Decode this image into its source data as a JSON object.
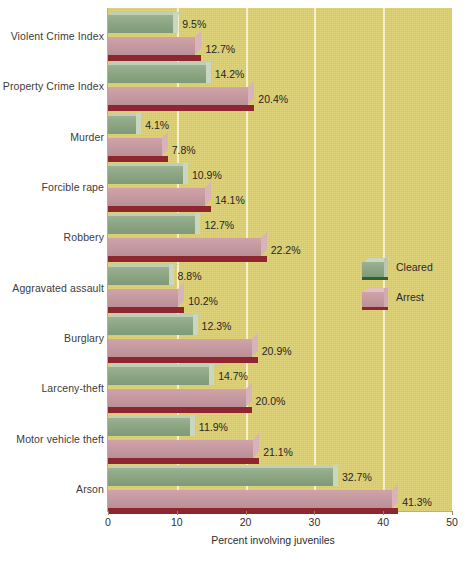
{
  "chart_data": {
    "type": "bar",
    "orientation": "horizontal",
    "title": "",
    "xlabel": "Percent involving juveniles",
    "ylabel": "",
    "xlim": [
      0,
      50
    ],
    "xticks": [
      "0",
      "10",
      "20",
      "30",
      "40",
      "50"
    ],
    "grid": "vertical gridlines at 10, 20, 30, 40",
    "legend_position": "middle-right inside plot",
    "categories": [
      "Violent Crime Index",
      "Property Crime Index",
      "Murder",
      "Forcible rape",
      "Robbery",
      "Aggravated assault",
      "Burglary",
      "Larceny-theft",
      "Motor vehicle theft",
      "Arson"
    ],
    "series": [
      {
        "name": "Cleared",
        "color": "#8fa886",
        "values": [
          9.5,
          14.2,
          4.1,
          10.9,
          12.7,
          8.8,
          12.3,
          14.7,
          11.9,
          32.7
        ],
        "labels": [
          "9.5%",
          "14.2%",
          "4.1%",
          "10.9%",
          "12.7%",
          "8.8%",
          "12.3%",
          "14.7%",
          "11.9%",
          "32.7%"
        ]
      },
      {
        "name": "Arrest",
        "color": "#c79ba2",
        "values": [
          12.7,
          20.4,
          7.8,
          14.1,
          22.2,
          10.2,
          20.9,
          20.0,
          21.1,
          41.3
        ],
        "labels": [
          "12.7%",
          "20.4%",
          "7.8%",
          "14.1%",
          "22.2%",
          "10.2%",
          "20.9%",
          "20.0%",
          "21.1%",
          "41.3%"
        ]
      }
    ],
    "plot_background": "#ddd070",
    "gridline_color": "#f3efcf"
  },
  "legend": {
    "items": [
      {
        "label": "Cleared",
        "key": "cleared"
      },
      {
        "label": "Arrest",
        "key": "arrest"
      }
    ]
  },
  "axis": {
    "x_title": "Percent involving juveniles"
  }
}
